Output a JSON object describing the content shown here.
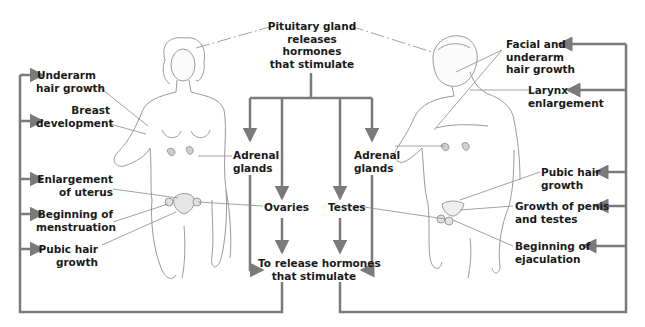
{
  "diagram": {
    "title_node": {
      "lines": [
        "Pituitary gland",
        "releases",
        "hormones",
        "that stimulate"
      ]
    },
    "glands": {
      "female_adrenal": {
        "lines": [
          "Adrenal",
          "glands"
        ]
      },
      "male_adrenal": {
        "lines": [
          "Adrenal",
          "glands"
        ]
      },
      "ovaries": {
        "label": "Ovaries"
      },
      "testes": {
        "label": "Testes"
      }
    },
    "release_node": {
      "lines": [
        "To release hormones",
        "that stimulate"
      ]
    },
    "female_effects": [
      {
        "lines": [
          "Underarm",
          "hair growth"
        ]
      },
      {
        "lines": [
          "Breast",
          "development"
        ]
      },
      {
        "lines": [
          "Enlargement",
          "of uterus"
        ]
      },
      {
        "lines": [
          "Beginning of",
          "menstruation"
        ]
      },
      {
        "lines": [
          "Pubic hair",
          "growth"
        ]
      }
    ],
    "male_effects": [
      {
        "lines": [
          "Facial and",
          "underarm",
          "hair growth"
        ]
      },
      {
        "lines": [
          "Larynx",
          "enlargement"
        ]
      },
      {
        "lines": [
          "Pubic hair",
          "growth"
        ]
      },
      {
        "lines": [
          "Growth of penis",
          "and testes"
        ]
      },
      {
        "lines": [
          "Beginning of",
          "ejaculation"
        ]
      }
    ],
    "figures": {
      "left": "female-body-illustration",
      "right": "male-body-illustration"
    },
    "colors": {
      "arrow": "#7a7a7a",
      "leader": "#8a8a8a",
      "text": "#1a1a1a",
      "sketch": "#9a9a9a"
    }
  }
}
